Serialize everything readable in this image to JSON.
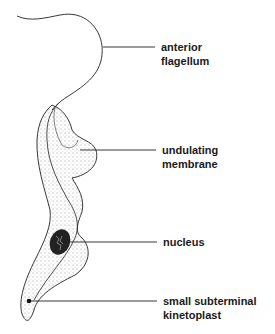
{
  "diagram": {
    "labels": [
      {
        "id": "anterior-flagellum",
        "line1": "anterior",
        "line2": "flagellum"
      },
      {
        "id": "undulating-membrane",
        "line1": "undulating",
        "line2": "membrane"
      },
      {
        "id": "nucleus",
        "line1": "nucleus",
        "line2": ""
      },
      {
        "id": "kinetoplast",
        "line1": "small subterminal",
        "line2": "kinetoplast"
      }
    ],
    "colors": {
      "ink": "#1a1a1a",
      "background": "#ffffff",
      "nucleus": "#222222"
    }
  }
}
